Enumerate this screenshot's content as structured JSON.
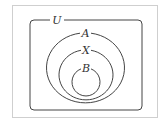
{
  "diagram": {
    "type": "venn-nested-sets",
    "universe": {
      "label": "U"
    },
    "sets": [
      {
        "id": "A",
        "label": "A",
        "contains": [
          "X"
        ]
      },
      {
        "id": "X",
        "label": "X",
        "contains": [
          "B"
        ]
      },
      {
        "id": "B",
        "label": "B",
        "contains": []
      }
    ],
    "relation": "B ⊂ X ⊂ A ⊂ U",
    "colors": {
      "stroke": "#444444",
      "frame": "#cccccc",
      "background": "#ffffff"
    }
  }
}
